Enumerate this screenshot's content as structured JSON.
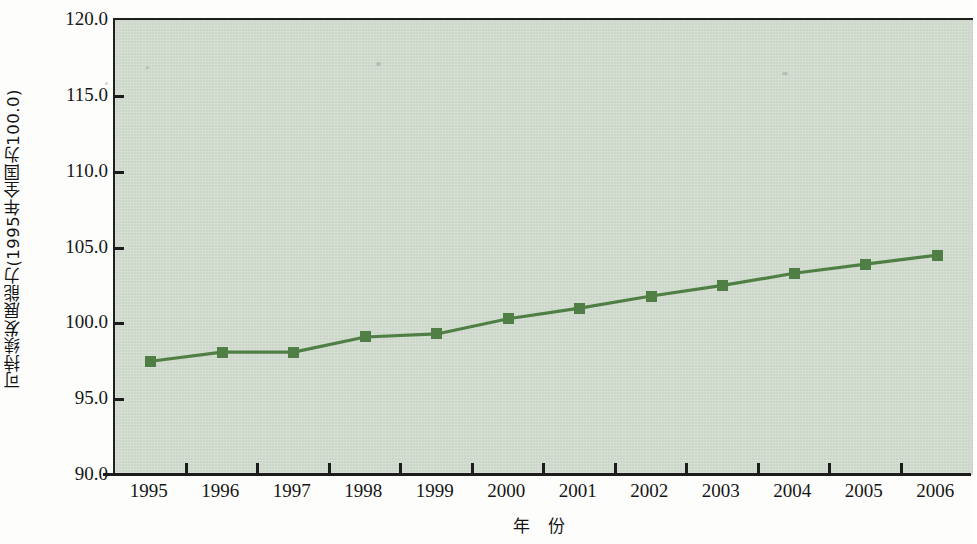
{
  "chart_data": {
    "type": "line",
    "title": "",
    "subtitle": "",
    "xlabel": "年 份",
    "ylabel": "可持续发展能力(1995年全国为100.0)",
    "categories": [
      "1995",
      "1996",
      "1997",
      "1998",
      "1999",
      "2000",
      "2001",
      "2002",
      "2003",
      "2004",
      "2005",
      "2006"
    ],
    "x": [
      1995,
      1996,
      1997,
      1998,
      1999,
      2000,
      2001,
      2002,
      2003,
      2004,
      2005,
      2006
    ],
    "values": [
      97.5,
      98.1,
      98.1,
      99.1,
      99.3,
      100.3,
      101.0,
      101.8,
      102.5,
      103.3,
      103.9,
      104.5
    ],
    "series": [
      {
        "name": "可持续发展能力",
        "values": [
          97.5,
          98.1,
          98.1,
          99.1,
          99.3,
          100.3,
          101.0,
          101.8,
          102.5,
          103.3,
          103.9,
          104.5
        ]
      }
    ],
    "ylim": [
      90.0,
      120.0
    ],
    "yticks": [
      90.0,
      95.0,
      100.0,
      105.0,
      110.0,
      115.0,
      120.0
    ],
    "ytick_labels": [
      "90.0",
      "95.0",
      "100.0",
      "105.0",
      "110.0",
      "115.0",
      "120.0"
    ],
    "xtick_labels": [
      "1995",
      "1996",
      "1997",
      "1998",
      "1999",
      "2000",
      "2001",
      "2002",
      "2003",
      "2004",
      "2005",
      "2006"
    ],
    "grid": false,
    "legend": "none",
    "marker": "square",
    "colors": {
      "line": "#4f7f45",
      "marker": "#4f7f45",
      "plot_background": "#ccd7c9",
      "axis": "#1c1c1c",
      "text": "#161616",
      "page_background": "#fdfdfc"
    }
  }
}
